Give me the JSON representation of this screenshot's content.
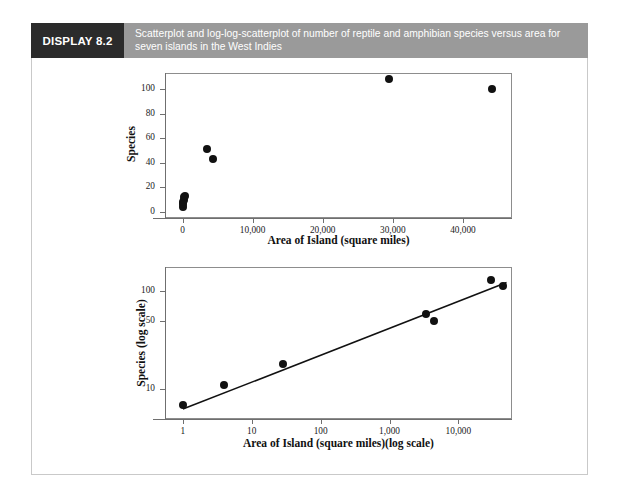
{
  "display": {
    "tag": "DISPLAY 8.2",
    "caption_line_1": "Scatterplot and log-log-scatterplot of number of reptile and amphibian species versus area for",
    "caption_line_2": "seven islands in the West Indies",
    "tag_bg": "#2b2b2b",
    "caption_bg": "#9a9a9a",
    "caption_color": "#ffffff",
    "frame_color": "#c9c9c9",
    "page_bg": "#ffffff"
  },
  "chart_data": [
    {
      "id": "top-scatterplot",
      "type": "scatter",
      "title": "",
      "xlabel": "Area of Island (square miles)",
      "ylabel": "Species",
      "xscale": "linear",
      "yscale": "linear",
      "xlim": [
        -2500,
        47000
      ],
      "ylim": [
        -5,
        113
      ],
      "xticks": [
        0,
        10000,
        20000,
        30000,
        40000
      ],
      "xticklabels": [
        "0",
        "10,000",
        "20,000",
        "30,000",
        "40,000"
      ],
      "yticks": [
        0,
        20,
        40,
        60,
        80,
        100
      ],
      "yticklabels": [
        "0",
        "20",
        "40",
        "60",
        "80",
        "100"
      ],
      "grid": false,
      "legend": "none",
      "marker_color": "#111111",
      "points": [
        {
          "x": 40,
          "y": 4,
          "label": "Redonda"
        },
        {
          "x": 55,
          "y": 6,
          "label": "Saba"
        },
        {
          "x": 100,
          "y": 8,
          "label": "Montserrat"
        },
        {
          "x": 170,
          "y": 10,
          "label": "Antigua"
        },
        {
          "x": 250,
          "y": 12,
          "label": "Barbuda"
        },
        {
          "x": 300,
          "y": 13,
          "label": "Guadeloupe-area"
        },
        {
          "x": 3435,
          "y": 51,
          "label": "Puerto Rico"
        },
        {
          "x": 4411,
          "y": 43,
          "label": "Jamaica"
        },
        {
          "x": 29418,
          "y": 108,
          "label": "Hispaniola"
        },
        {
          "x": 44218,
          "y": 100,
          "label": "Cuba"
        }
      ]
    },
    {
      "id": "bottom-log-log-scatterplot",
      "type": "scatter",
      "title": "",
      "xlabel": "Area of Island (square miles)(log scale)",
      "ylabel": "Species (log scale)",
      "xscale": "log",
      "yscale": "log",
      "xlim": [
        0.55,
        60000
      ],
      "ylim": [
        5.0,
        175
      ],
      "xticks": [
        1,
        10,
        100,
        1000,
        10000
      ],
      "xticklabels": [
        "1",
        "10",
        "100",
        "1,000",
        "10,000"
      ],
      "yticks": [
        10,
        50,
        100
      ],
      "yticklabels": [
        "10",
        "50",
        "100"
      ],
      "grid": false,
      "legend": "none",
      "marker_color": "#111111",
      "points": [
        {
          "x": 1,
          "y": 7,
          "label": "Redonda"
        },
        {
          "x": 4,
          "y": 11,
          "label": "Saba"
        },
        {
          "x": 28,
          "y": 18,
          "label": "Montserrat"
        },
        {
          "x": 3435,
          "y": 58,
          "label": "Puerto Rico"
        },
        {
          "x": 4411,
          "y": 49,
          "label": "Jamaica"
        },
        {
          "x": 29418,
          "y": 130,
          "label": "Hispaniola"
        },
        {
          "x": 44218,
          "y": 113,
          "label": "Cuba"
        }
      ],
      "fit_line": {
        "type": "linear-on-log-log",
        "x_start": 1,
        "y_start": 6.3,
        "x_end": 50000,
        "y_end": 122,
        "color": "#111111"
      }
    }
  ]
}
